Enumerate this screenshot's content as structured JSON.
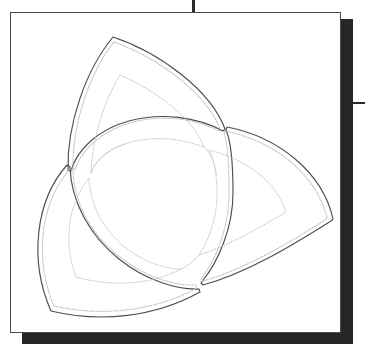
{
  "page": {
    "background_color": "#ffffff",
    "width": 365,
    "height": 344
  },
  "card": {
    "name": "framed-drawing",
    "border_color": "#4a4a4a",
    "fill_color": "#ffffff",
    "x": 10,
    "y": 12,
    "width": 331,
    "height": 321
  },
  "shadow": {
    "color": "#262626",
    "right_offset": 12,
    "bottom_offset": 12
  },
  "marks": {
    "top_tick": {
      "name": "registration-tick-top",
      "x": 192,
      "y": 0,
      "length": 22,
      "color": "#2b2b2b"
    },
    "right_tick": {
      "name": "registration-tick-right",
      "x": 348,
      "y": 102,
      "length": 17,
      "color": "#2b2b2b"
    }
  },
  "figure": {
    "name": "triquetra",
    "outline_color": "#4e4e52",
    "dotted_color": "#b9b9bd",
    "lobe_count": 3,
    "cusps": [
      {
        "label": "top-apex",
        "x": 112,
        "y": 36
      },
      {
        "label": "left-cusp",
        "x": 78,
        "y": 172
      },
      {
        "label": "upper-right-cusp",
        "x": 222,
        "y": 128
      },
      {
        "label": "bottom-cusp",
        "x": 193,
        "y": 268
      },
      {
        "label": "bottom-left-tip",
        "x": 50,
        "y": 310
      },
      {
        "label": "right-tip",
        "x": 330,
        "y": 218
      }
    ],
    "layers": [
      {
        "label": "outer-solid-contour",
        "style": "solid"
      },
      {
        "label": "outer-dotted-contour",
        "style": "dotted"
      },
      {
        "label": "inner-dotted-contour",
        "style": "dotted"
      }
    ]
  }
}
